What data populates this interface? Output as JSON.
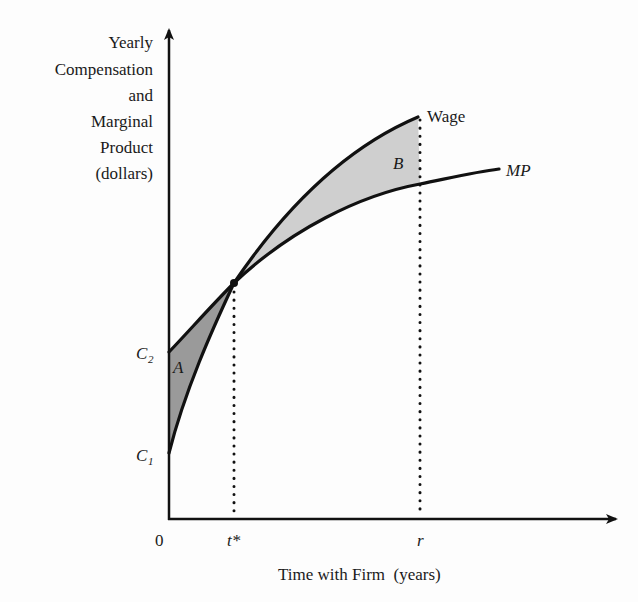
{
  "figure": {
    "y_axis_label_lines": [
      "Yearly",
      "Compensation",
      "and",
      "Marginal",
      "Product",
      "(dollars)"
    ],
    "x_axis_label": "Time with Firm  (years)",
    "origin_label": "0",
    "x_ticks": {
      "t_star": "t*",
      "r": "r"
    },
    "y_ticks": {
      "c2": "C",
      "c2_sub": "2",
      "c1": "C",
      "c1_sub": "1"
    },
    "curve_labels": {
      "wage": "Wage",
      "mp": "MP"
    },
    "area_labels": {
      "a": "A",
      "b": "B"
    },
    "colors": {
      "line": "#111111",
      "area_a_fill": "#9a9a9a",
      "area_b_fill": "#cfcfcf",
      "background": "#fdfdfd"
    }
  }
}
